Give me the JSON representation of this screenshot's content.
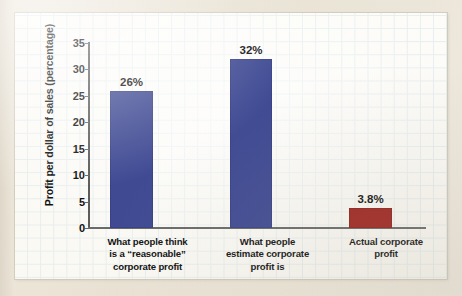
{
  "chart_data": {
    "type": "bar",
    "title": "",
    "xlabel": "",
    "ylabel": "Profit per dollar of sales (percentage)",
    "ylim": [
      0,
      35
    ],
    "yticks": [
      "35",
      "30",
      "25",
      "20",
      "15",
      "10",
      "5",
      "0"
    ],
    "grid": true,
    "legend": "none",
    "categories": [
      "What people think is a “reasonable” corporate profit",
      "What people estimate corporate profit is",
      "Actual corporate profit"
    ],
    "category_lines": [
      [
        "What people think",
        "is a “reasonable”",
        "corporate profit"
      ],
      [
        "What people",
        "estimate corporate",
        "profit is"
      ],
      [
        "Actual corporate",
        "profit"
      ]
    ],
    "values": [
      26,
      32,
      3.8
    ],
    "value_labels": [
      "26%",
      "32%",
      "3.8%"
    ],
    "bar_colors": [
      "#3f4a93",
      "#3f4a93",
      "#9f2420"
    ]
  },
  "colors": {
    "bar_blue": "#3f4a93",
    "bar_red": "#9f2420",
    "grid_line": "#cfe2ec",
    "axis": "#6a6a6a",
    "panel_background": "#fdfdfb",
    "page_background": "#ece6da",
    "text": "#111111"
  }
}
